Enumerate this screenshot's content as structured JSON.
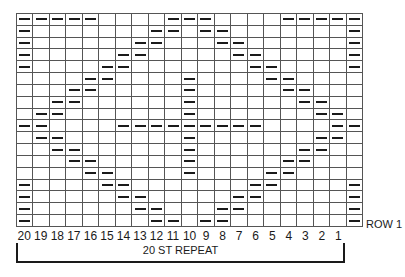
{
  "chart": {
    "type": "knitting-chart",
    "columns": [
      "20",
      "19",
      "18",
      "17",
      "16",
      "15",
      "14",
      "13",
      "12",
      "11",
      "10",
      "9",
      "8",
      "7",
      "6",
      "5",
      "4",
      "3",
      "2",
      "1",
      "E"
    ],
    "column_labels": [
      "20",
      "19",
      "18",
      "17",
      "16",
      "15",
      "14",
      "13",
      "12",
      "11",
      "10",
      "9",
      "8",
      "7",
      "6",
      "5",
      "4",
      "3",
      "2",
      "1"
    ],
    "symbol": "purl-dash",
    "rows_top_to_bottom": [
      [
        "20",
        "19",
        "18",
        "17",
        "16",
        "11",
        "10",
        "9",
        "4",
        "3",
        "2",
        "1",
        "E"
      ],
      [
        "20",
        "12",
        "11",
        "9",
        "8",
        "E"
      ],
      [
        "20",
        "13",
        "12",
        "8",
        "7",
        "E"
      ],
      [
        "20",
        "14",
        "13",
        "7",
        "6",
        "E"
      ],
      [
        "20",
        "15",
        "14",
        "6",
        "5",
        "E"
      ],
      [
        "16",
        "15",
        "10",
        "5",
        "4"
      ],
      [
        "17",
        "16",
        "10",
        "4",
        "3"
      ],
      [
        "18",
        "17",
        "10",
        "3",
        "2"
      ],
      [
        "19",
        "18",
        "10",
        "2",
        "1"
      ],
      [
        "20",
        "19",
        "14",
        "13",
        "12",
        "11",
        "10",
        "9",
        "8",
        "7",
        "6",
        "1",
        "E"
      ],
      [
        "19",
        "18",
        "10",
        "2",
        "1"
      ],
      [
        "18",
        "17",
        "10",
        "3",
        "2"
      ],
      [
        "17",
        "16",
        "10",
        "4",
        "3"
      ],
      [
        "16",
        "15",
        "10",
        "5",
        "4"
      ],
      [
        "20",
        "15",
        "14",
        "6",
        "5",
        "E"
      ],
      [
        "20",
        "14",
        "13",
        "7",
        "6",
        "E"
      ],
      [
        "20",
        "13",
        "12",
        "8",
        "7",
        "E"
      ],
      [
        "20",
        "12",
        "11",
        "9",
        "8",
        "E"
      ]
    ]
  },
  "labels": {
    "row1": "ROW 1",
    "repeat": "20 ST REPEAT"
  }
}
